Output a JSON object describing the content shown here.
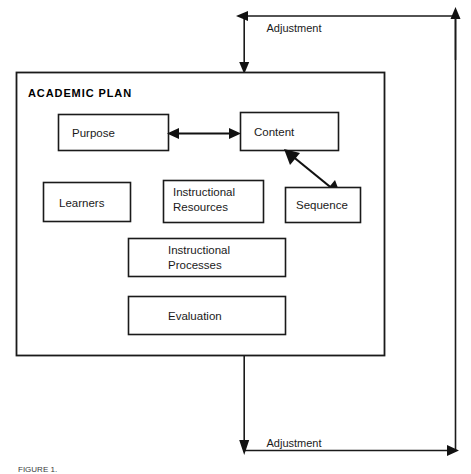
{
  "figure": {
    "container": {
      "title": "ACADEMIC PLAN"
    },
    "nodes": [
      {
        "id": "purpose",
        "label": "Purpose"
      },
      {
        "id": "content",
        "label": "Content"
      },
      {
        "id": "learners",
        "label": "Learners"
      },
      {
        "id": "instructional-resources",
        "label_line1": "Instructional",
        "label_line2": "Resources"
      },
      {
        "id": "sequence",
        "label": "Sequence"
      },
      {
        "id": "instructional-processes",
        "label_line1": "Instructional",
        "label_line2": "Processes"
      },
      {
        "id": "evaluation",
        "label": "Evaluation"
      }
    ],
    "flows": {
      "top_adjustment_label": "Adjustment",
      "bottom_adjustment_label": "Adjustment"
    },
    "caption": "FIGURE 1.",
    "colors": {
      "ink": "#1a1a1a",
      "background": "#ffffff",
      "arrow": "#111111"
    }
  }
}
